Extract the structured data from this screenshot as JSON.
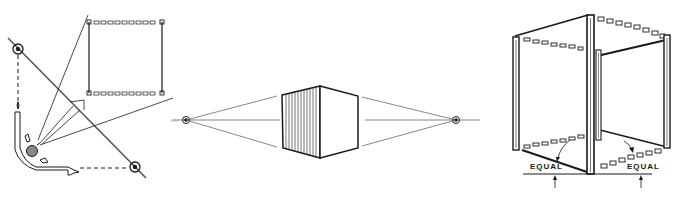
{
  "figures": [
    {
      "id": "viewer-picture-plane",
      "description": "Viewer looking through a picture plane at a square window; sight lines and vanishing points projected"
    },
    {
      "id": "two-point-box",
      "description": "Box drawn in two-point perspective with left and right vanishing points on a horizon line"
    },
    {
      "id": "open-cube-frame",
      "description": "Open cube frame in perspective showing equal side measurements",
      "labels": [
        "EQUAL",
        "EQUAL"
      ]
    }
  ],
  "colors": {
    "ink": "#1a1a1a",
    "paper": "#ffffff"
  }
}
